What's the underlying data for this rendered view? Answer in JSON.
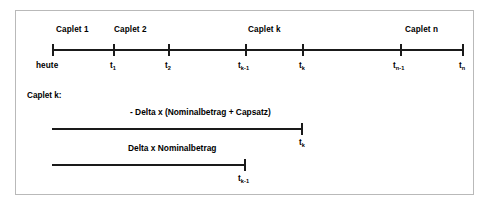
{
  "figure": {
    "name": "caplet-timeline-diagram",
    "background_color": "#ffffff",
    "frame_border_color": "#b9b9b9",
    "line_color": "#1a1a1a"
  },
  "timeline": {
    "caplet_labels": [
      {
        "text": "Caplet 1",
        "center_x": 83
      },
      {
        "text": "Caplet 2",
        "center_x": 141
      },
      {
        "text": "Caplet k",
        "center_x": 274
      },
      {
        "text": "Caplet n",
        "center_x": 431
      }
    ],
    "ticks": [
      {
        "label": "heute",
        "sub": "",
        "x": 52
      },
      {
        "label": "t",
        "sub": "1",
        "x": 113
      },
      {
        "label": "t",
        "sub": "2",
        "x": 168
      },
      {
        "label": "t",
        "sub": "k-1",
        "x": 245
      },
      {
        "label": "t",
        "sub": "k",
        "x": 302
      },
      {
        "label": "t",
        "sub": "n-1",
        "x": 400
      },
      {
        "label": "t",
        "sub": "n",
        "x": 462
      }
    ],
    "axis_y": 50,
    "axis_start_x": 52,
    "axis_end_x": 462
  },
  "detail": {
    "title": "Caplet k:",
    "flows": [
      {
        "label": "- Delta x (Nominalbetrag + Capsatz)",
        "label_center_x": 219,
        "label_y": 109,
        "bar_y": 128,
        "bar_start_x": 52,
        "bar_end_x": 302,
        "end_tick_label": "t",
        "end_tick_sub": "k",
        "end_tick_x": 302
      },
      {
        "label": "Delta x Nominalbetrag",
        "label_center_x": 196,
        "label_y": 145,
        "bar_y": 164,
        "bar_start_x": 52,
        "bar_end_x": 245,
        "end_tick_label": "t",
        "end_tick_sub": "k-1",
        "end_tick_x": 245
      }
    ]
  }
}
